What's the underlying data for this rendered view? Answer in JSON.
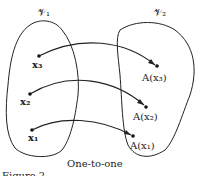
{
  "sets": {
    "left": "𝒱₁",
    "right": "𝒱₂"
  },
  "points": {
    "x3": "x₃",
    "x2": "x₂",
    "x1": "x₁"
  },
  "images": {
    "a3": "A(x₃)",
    "a2": "A(x₂)",
    "a1": "A(x₁)"
  },
  "caption": "One-to-one",
  "figure_label": "Figure 2-"
}
